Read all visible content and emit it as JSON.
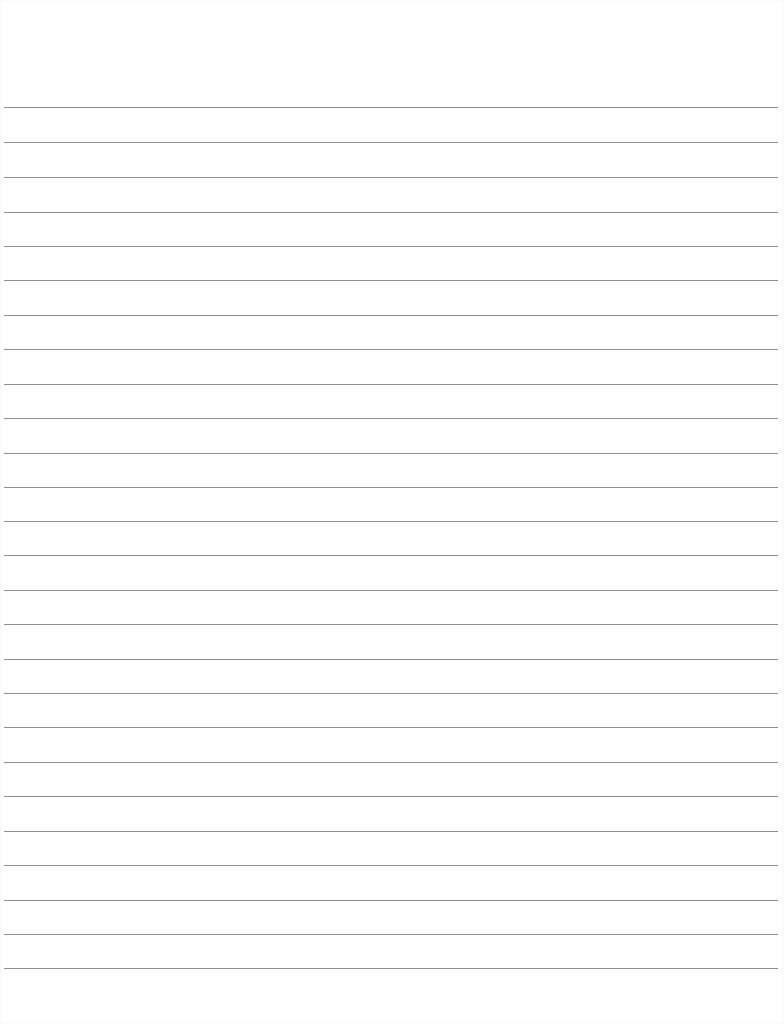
{
  "page": {
    "type": "lined-paper",
    "background_color": "#ffffff",
    "rule_color": "#8f8f8f",
    "rules_y": [
      107,
      142,
      177,
      212,
      246,
      280,
      315,
      349,
      384,
      418,
      453,
      487,
      521,
      555,
      590,
      624,
      659,
      693,
      727,
      762,
      796,
      831,
      865,
      900,
      934,
      968
    ]
  }
}
